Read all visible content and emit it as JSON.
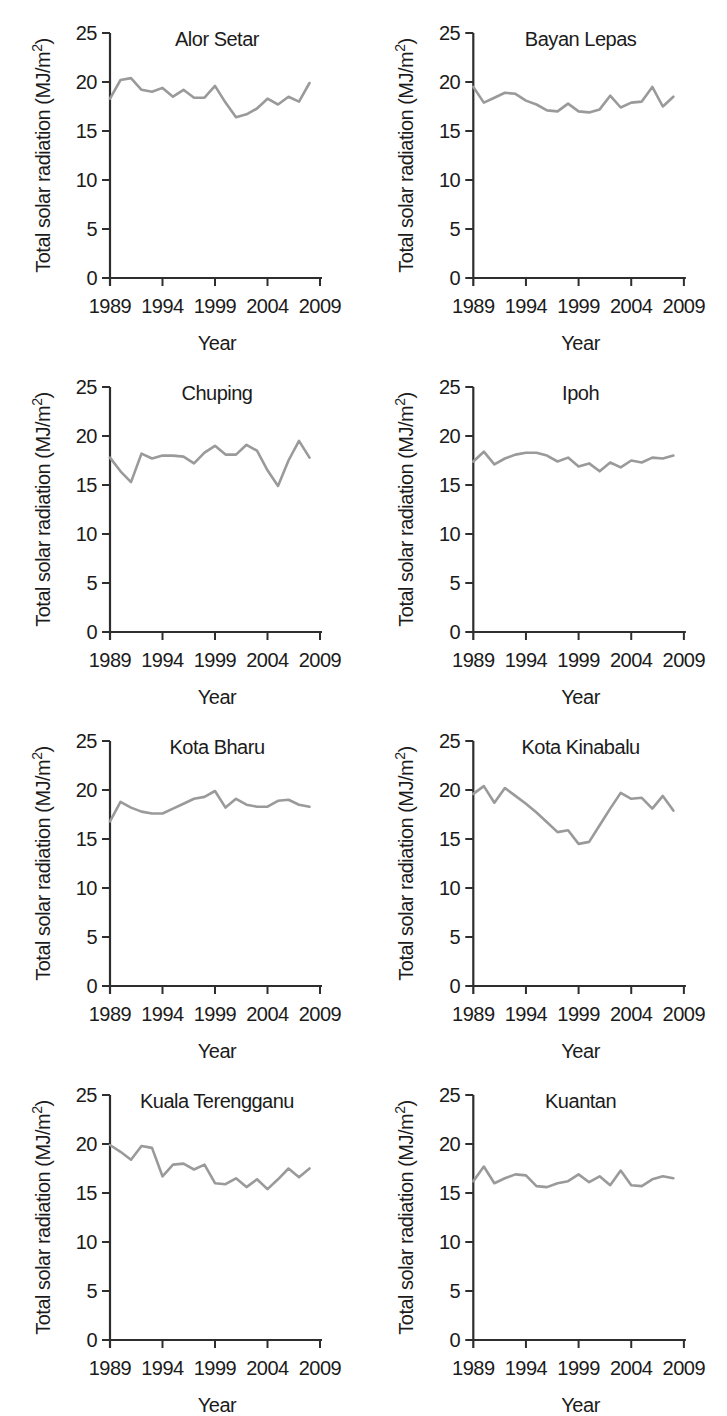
{
  "figure": {
    "xlabel": "Year",
    "ylabel": {
      "text": "Total solar radiation (MJ/m",
      "sup": "2",
      "close": ")"
    },
    "y_ticks": [
      0,
      5,
      10,
      15,
      20,
      25
    ],
    "x_ticks": [
      1989,
      1994,
      1999,
      2004,
      2009
    ],
    "y_tick_labels": [
      "0",
      "5",
      "10",
      "15",
      "20",
      "25"
    ],
    "x_tick_labels": [
      "1989",
      "1994",
      "1999",
      "2004",
      "2009"
    ],
    "colors": {
      "line": "#9a9a9a",
      "axis": "#2e2e2e",
      "text": "#1b1b1b",
      "background": "#ffffff"
    }
  },
  "chart_data": [
    {
      "type": "line",
      "title": "Alor Setar",
      "xlabel": "Year",
      "ylabel": "Total solar radiation (MJ/m2)",
      "xlim": [
        1989,
        2009
      ],
      "ylim": [
        0,
        25
      ],
      "x": [
        1989,
        1990,
        1991,
        1992,
        1993,
        1994,
        1995,
        1996,
        1997,
        1998,
        1999,
        2000,
        2001,
        2002,
        2003,
        2004,
        2005,
        2006,
        2007,
        2008
      ],
      "values": [
        18.3,
        20.2,
        20.4,
        19.2,
        19.0,
        19.4,
        18.5,
        19.2,
        18.4,
        18.4,
        19.6,
        17.9,
        16.4,
        16.7,
        17.3,
        18.3,
        17.7,
        18.5,
        18.0,
        19.9
      ]
    },
    {
      "type": "line",
      "title": "Bayan Lepas",
      "xlabel": "Year",
      "ylabel": "Total solar radiation (MJ/m2)",
      "xlim": [
        1989,
        2009
      ],
      "ylim": [
        0,
        25
      ],
      "x": [
        1989,
        1990,
        1991,
        1992,
        1993,
        1994,
        1995,
        1996,
        1997,
        1998,
        1999,
        2000,
        2001,
        2002,
        2003,
        2004,
        2005,
        2006,
        2007,
        2008
      ],
      "values": [
        19.5,
        17.9,
        18.4,
        18.9,
        18.8,
        18.1,
        17.7,
        17.1,
        17.0,
        17.8,
        17.0,
        16.9,
        17.2,
        18.6,
        17.4,
        17.9,
        18.0,
        19.5,
        17.5,
        18.5
      ]
    },
    {
      "type": "line",
      "title": "Chuping",
      "xlabel": "Year",
      "ylabel": "Total solar radiation (MJ/m2)",
      "xlim": [
        1989,
        2009
      ],
      "ylim": [
        0,
        25
      ],
      "x": [
        1989,
        1990,
        1991,
        1992,
        1993,
        1994,
        1995,
        1996,
        1997,
        1998,
        1999,
        2000,
        2001,
        2002,
        2003,
        2004,
        2005,
        2006,
        2007,
        2008
      ],
      "values": [
        17.8,
        16.4,
        15.3,
        18.2,
        17.7,
        18.0,
        18.0,
        17.9,
        17.2,
        18.3,
        19.0,
        18.1,
        18.1,
        19.1,
        18.5,
        16.5,
        14.9,
        17.5,
        19.5,
        17.8
      ]
    },
    {
      "type": "line",
      "title": "Ipoh",
      "xlabel": "Year",
      "ylabel": "Total solar radiation (MJ/m2)",
      "xlim": [
        1989,
        2009
      ],
      "ylim": [
        0,
        25
      ],
      "x": [
        1989,
        1990,
        1991,
        1992,
        1993,
        1994,
        1995,
        1996,
        1997,
        1998,
        1999,
        2000,
        2001,
        2002,
        2003,
        2004,
        2005,
        2006,
        2007,
        2008
      ],
      "values": [
        17.4,
        18.4,
        17.1,
        17.7,
        18.1,
        18.3,
        18.3,
        18.0,
        17.4,
        17.8,
        16.9,
        17.2,
        16.4,
        17.3,
        16.8,
        17.5,
        17.3,
        17.8,
        17.7,
        18.0
      ]
    },
    {
      "type": "line",
      "title": "Kota Bharu",
      "xlabel": "Year",
      "ylabel": "Total solar radiation (MJ/m2)",
      "xlim": [
        1989,
        2009
      ],
      "ylim": [
        0,
        25
      ],
      "x": [
        1989,
        1990,
        1991,
        1992,
        1993,
        1994,
        1995,
        1996,
        1997,
        1998,
        1999,
        2000,
        2001,
        2002,
        2003,
        2004,
        2005,
        2006,
        2007,
        2008
      ],
      "values": [
        16.8,
        18.8,
        18.2,
        17.8,
        17.6,
        17.6,
        18.1,
        18.6,
        19.1,
        19.3,
        19.9,
        18.2,
        19.1,
        18.5,
        18.3,
        18.3,
        18.9,
        19.0,
        18.5,
        18.3
      ]
    },
    {
      "type": "line",
      "title": "Kota Kinabalu",
      "xlabel": "Year",
      "ylabel": "Total solar radiation (MJ/m2)",
      "xlim": [
        1989,
        2009
      ],
      "ylim": [
        0,
        25
      ],
      "x": [
        1989,
        1990,
        1991,
        1992,
        1993,
        1994,
        1995,
        1996,
        1997,
        1998,
        1999,
        2000,
        2001,
        2002,
        2003,
        2004,
        2005,
        2006,
        2007,
        2008
      ],
      "values": [
        19.6,
        20.4,
        18.7,
        20.2,
        19.4,
        18.6,
        17.7,
        16.7,
        15.7,
        15.9,
        14.5,
        14.7,
        16.4,
        18.1,
        19.7,
        19.1,
        19.2,
        18.1,
        19.4,
        17.9
      ]
    },
    {
      "type": "line",
      "title": "Kuala Terengganu",
      "xlabel": "Year",
      "ylabel": "Total solar radiation (MJ/m2)",
      "xlim": [
        1989,
        2009
      ],
      "ylim": [
        0,
        25
      ],
      "x": [
        1989,
        1990,
        1991,
        1992,
        1993,
        1994,
        1995,
        1996,
        1997,
        1998,
        1999,
        2000,
        2001,
        2002,
        2003,
        2004,
        2005,
        2006,
        2007,
        2008
      ],
      "values": [
        19.9,
        19.2,
        18.4,
        19.8,
        19.6,
        16.7,
        17.9,
        18.0,
        17.4,
        17.9,
        16.0,
        15.9,
        16.5,
        15.6,
        16.4,
        15.4,
        16.4,
        17.5,
        16.6,
        17.5
      ]
    },
    {
      "type": "line",
      "title": "Kuantan",
      "xlabel": "Year",
      "ylabel": "Total solar radiation (MJ/m2)",
      "xlim": [
        1989,
        2009
      ],
      "ylim": [
        0,
        25
      ],
      "x": [
        1989,
        1990,
        1991,
        1992,
        1993,
        1994,
        1995,
        1996,
        1997,
        1998,
        1999,
        2000,
        2001,
        2002,
        2003,
        2004,
        2005,
        2006,
        2007,
        2008
      ],
      "values": [
        16.2,
        17.7,
        16.0,
        16.5,
        16.9,
        16.8,
        15.7,
        15.6,
        16.0,
        16.2,
        16.9,
        16.1,
        16.7,
        15.8,
        17.3,
        15.8,
        15.7,
        16.4,
        16.7,
        16.5
      ]
    }
  ]
}
